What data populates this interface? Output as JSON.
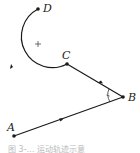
{
  "diagram": {
    "type": "motion-path",
    "points": {
      "A": {
        "label": "A",
        "x": 14,
        "y": 136
      },
      "B": {
        "label": "B",
        "x": 123,
        "y": 97
      },
      "C": {
        "label": "C",
        "x": 67,
        "y": 64
      },
      "D": {
        "label": "D",
        "x": 38,
        "y": 9
      }
    },
    "center_mark": {
      "symbol": "+",
      "x": 38,
      "y": 44
    },
    "segments": [
      {
        "from": "A",
        "to": "B",
        "kind": "line",
        "arrow": true
      },
      {
        "from": "B",
        "to": "C",
        "kind": "line",
        "arrow": true
      },
      {
        "from": "C",
        "to": "D",
        "kind": "arc",
        "arrow": true
      }
    ],
    "angle_mark": {
      "at": "B"
    },
    "caption": "图 3-… 运动轨迹示意"
  },
  "colors": {
    "stroke": "#1a1a1a",
    "label": "#222222"
  }
}
